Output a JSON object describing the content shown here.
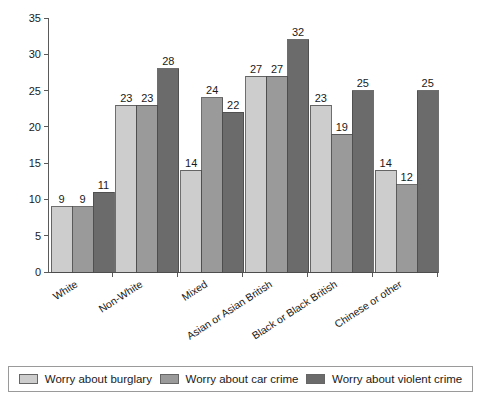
{
  "chart_data": {
    "type": "bar",
    "title": "",
    "xlabel": "",
    "ylabel": "",
    "ylim": [
      0,
      35
    ],
    "yticks": [
      0,
      5,
      10,
      15,
      20,
      25,
      30,
      35
    ],
    "grid": false,
    "legend_position": "bottom",
    "categories": [
      "White",
      "Non-White",
      "Mixed",
      "Asian or Asian British",
      "Black or Black British",
      "Chinese or other"
    ],
    "series": [
      {
        "name": "Worry about burglary",
        "color": "#cdcdcd",
        "values": [
          9,
          23,
          14,
          27,
          23,
          14
        ]
      },
      {
        "name": "Worry about car crime",
        "color": "#9a9a9a",
        "values": [
          9,
          23,
          24,
          27,
          19,
          12
        ]
      },
      {
        "name": "Worry about violent crime",
        "color": "#6b6b6b",
        "values": [
          11,
          28,
          22,
          32,
          25,
          25
        ]
      }
    ]
  },
  "legend": {
    "items": [
      {
        "label": "Worry about burglary",
        "color": "#cdcdcd"
      },
      {
        "label": "Worry about car crime",
        "color": "#9a9a9a"
      },
      {
        "label": "Worry about violent crime",
        "color": "#6b6b6b"
      }
    ]
  },
  "axis": {
    "y_tick_labels": [
      "0",
      "5",
      "10",
      "15",
      "20",
      "25",
      "30",
      "35"
    ]
  }
}
